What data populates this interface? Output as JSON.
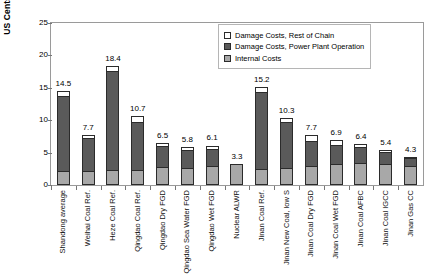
{
  "chart_data": {
    "type": "bar",
    "subtype": "stacked-bar",
    "title": "",
    "xlabel": "",
    "ylabel": "US Cents per kWh",
    "ylim": [
      0,
      25
    ],
    "yticks": [
      0,
      5,
      10,
      15,
      20,
      25
    ],
    "grid": false,
    "legend_position": "top-right",
    "categories": [
      "Shandong average",
      "Weihai Coal Ref.",
      "Heze Coal Ref.",
      "Qingdao Coal Ref.",
      "Qingdao Dry FGD",
      "Qingdao Sea Water FGD",
      "Qingdao Wet FGD",
      "Nuclear ALWR",
      "Jinan Coal Ref.",
      "Jinan New Coal, low S",
      "Jinan Coal Dry FGD",
      "Jinan Coal Wet FGD",
      "Jinan Coal AFBC",
      "Jinan Coal IGCC",
      "Jinan Gas CC"
    ],
    "series": [
      {
        "name": "Internal Costs",
        "color": "#a8a8a8",
        "values": [
          2.2,
          2.1,
          2.3,
          2.3,
          2.8,
          2.6,
          2.9,
          3.3,
          2.5,
          2.6,
          3.0,
          3.2,
          3.4,
          3.2,
          3.0
        ]
      },
      {
        "name": "Damage Costs, Power Plant Operation",
        "color": "#5a5a5a",
        "values": [
          11.6,
          5.1,
          15.3,
          7.5,
          3.2,
          2.8,
          2.6,
          0.0,
          11.9,
          7.1,
          3.8,
          3.0,
          2.5,
          1.9,
          1.1
        ]
      },
      {
        "name": "Damage Costs, Rest of Chain",
        "color": "#ffffff",
        "values": [
          0.7,
          0.5,
          0.8,
          0.9,
          0.5,
          0.4,
          0.6,
          0.0,
          0.8,
          0.6,
          0.9,
          0.7,
          0.5,
          0.3,
          0.2
        ]
      }
    ],
    "totals": [
      14.5,
      7.7,
      18.4,
      10.7,
      6.5,
      5.8,
      6.1,
      3.3,
      15.2,
      10.3,
      7.7,
      6.9,
      6.4,
      5.4,
      4.3
    ]
  },
  "legend": {
    "items": [
      {
        "label": "Damage Costs, Rest of Chain",
        "swatch": "chain"
      },
      {
        "label": "Damage Costs, Power Plant Operation",
        "swatch": "plant"
      },
      {
        "label": "Internal Costs",
        "swatch": "internal"
      }
    ]
  }
}
